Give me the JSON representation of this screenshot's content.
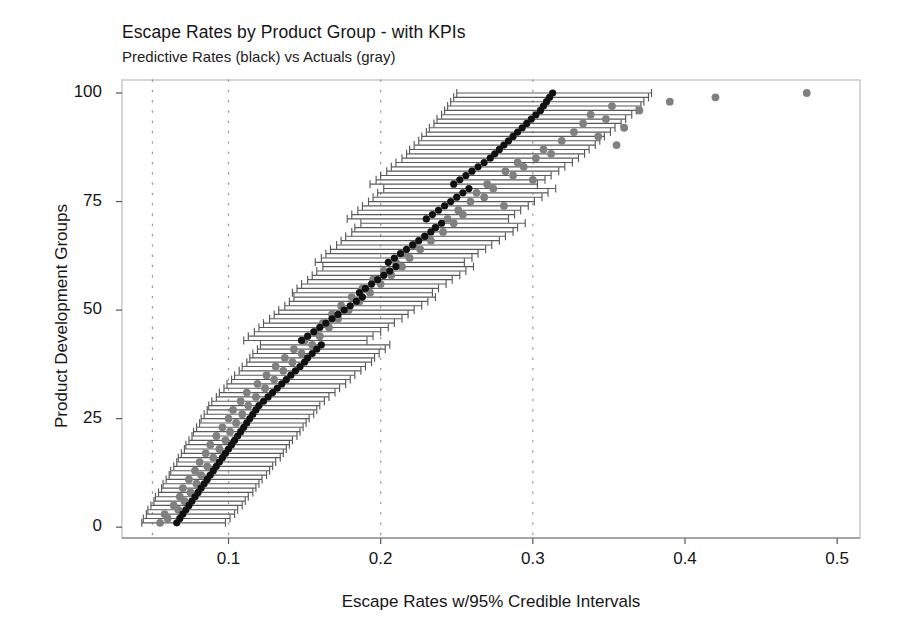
{
  "chart_data": {
    "type": "scatter",
    "title": "Escape Rates by Product Group - with KPIs",
    "subtitle": "Predictive Rates (black) vs Actuals (gray)",
    "xlabel": "Escape Rates w/95% Credible Intervals",
    "ylabel": "Product Development Groups",
    "xlim": [
      0.03,
      0.515
    ],
    "ylim": [
      -2.5,
      103
    ],
    "xticks": [
      0.1,
      0.2,
      0.3,
      0.4,
      0.5
    ],
    "xtick_labels": [
      "0.1",
      "0.2",
      "0.3",
      "0.4",
      "0.5"
    ],
    "yticks": [
      0,
      25,
      50,
      75,
      100
    ],
    "ytick_labels": [
      "0",
      "25",
      "50",
      "75",
      "100"
    ],
    "gridlines_x": [
      0.05,
      0.1,
      0.2,
      0.3
    ],
    "grid_style": "dotted-vertical",
    "grid_color": "#9a9a9a",
    "frame_color": "#bbbbbb",
    "colors": {
      "predictive": "#111111",
      "actual": "#808080",
      "errorbar": "#5a5a5a"
    },
    "legend": [
      {
        "name": "Predictive Rates",
        "color": "#111111",
        "marker": "filled-circle"
      },
      {
        "name": "Actuals",
        "color": "#808080",
        "marker": "filled-circle"
      }
    ],
    "series": [
      {
        "name": "Predictive Rates (black)",
        "marker": "filled-circle",
        "color": "#111111",
        "points": [
          {
            "group": 1,
            "predicted": 0.066,
            "lo": 0.043,
            "hi": 0.098,
            "actual": 0.055
          },
          {
            "group": 2,
            "predicted": 0.068,
            "lo": 0.044,
            "hi": 0.101,
            "actual": 0.06
          },
          {
            "group": 3,
            "predicted": 0.07,
            "lo": 0.046,
            "hi": 0.104,
            "actual": 0.058
          },
          {
            "group": 4,
            "predicted": 0.072,
            "lo": 0.047,
            "hi": 0.106,
            "actual": 0.067
          },
          {
            "group": 5,
            "predicted": 0.074,
            "lo": 0.049,
            "hi": 0.109,
            "actual": 0.064
          },
          {
            "group": 6,
            "predicted": 0.076,
            "lo": 0.051,
            "hi": 0.111,
            "actual": 0.071
          },
          {
            "group": 7,
            "predicted": 0.078,
            "lo": 0.052,
            "hi": 0.113,
            "actual": 0.068
          },
          {
            "group": 8,
            "predicted": 0.08,
            "lo": 0.054,
            "hi": 0.116,
            "actual": 0.075
          },
          {
            "group": 9,
            "predicted": 0.082,
            "lo": 0.056,
            "hi": 0.118,
            "actual": 0.07
          },
          {
            "group": 10,
            "predicted": 0.084,
            "lo": 0.057,
            "hi": 0.12,
            "actual": 0.079
          },
          {
            "group": 11,
            "predicted": 0.086,
            "lo": 0.059,
            "hi": 0.122,
            "actual": 0.074
          },
          {
            "group": 12,
            "predicted": 0.088,
            "lo": 0.061,
            "hi": 0.125,
            "actual": 0.082
          },
          {
            "group": 13,
            "predicted": 0.09,
            "lo": 0.062,
            "hi": 0.127,
            "actual": 0.078
          },
          {
            "group": 14,
            "predicted": 0.092,
            "lo": 0.064,
            "hi": 0.129,
            "actual": 0.086
          },
          {
            "group": 15,
            "predicted": 0.094,
            "lo": 0.066,
            "hi": 0.131,
            "actual": 0.081
          },
          {
            "group": 16,
            "predicted": 0.096,
            "lo": 0.067,
            "hi": 0.134,
            "actual": 0.09
          },
          {
            "group": 17,
            "predicted": 0.098,
            "lo": 0.069,
            "hi": 0.136,
            "actual": 0.085
          },
          {
            "group": 18,
            "predicted": 0.1,
            "lo": 0.071,
            "hi": 0.138,
            "actual": 0.094
          },
          {
            "group": 19,
            "predicted": 0.102,
            "lo": 0.072,
            "hi": 0.14,
            "actual": 0.088
          },
          {
            "group": 20,
            "predicted": 0.104,
            "lo": 0.074,
            "hi": 0.142,
            "actual": 0.098
          },
          {
            "group": 21,
            "predicted": 0.106,
            "lo": 0.076,
            "hi": 0.145,
            "actual": 0.092
          },
          {
            "group": 22,
            "predicted": 0.108,
            "lo": 0.077,
            "hi": 0.147,
            "actual": 0.101
          },
          {
            "group": 23,
            "predicted": 0.11,
            "lo": 0.079,
            "hi": 0.149,
            "actual": 0.096
          },
          {
            "group": 24,
            "predicted": 0.112,
            "lo": 0.081,
            "hi": 0.151,
            "actual": 0.105
          },
          {
            "group": 25,
            "predicted": 0.114,
            "lo": 0.082,
            "hi": 0.153,
            "actual": 0.1
          },
          {
            "group": 26,
            "predicted": 0.116,
            "lo": 0.084,
            "hi": 0.156,
            "actual": 0.109
          },
          {
            "group": 27,
            "predicted": 0.118,
            "lo": 0.086,
            "hi": 0.158,
            "actual": 0.103
          },
          {
            "group": 28,
            "predicted": 0.12,
            "lo": 0.087,
            "hi": 0.16,
            "actual": 0.113
          },
          {
            "group": 29,
            "predicted": 0.123,
            "lo": 0.089,
            "hi": 0.163,
            "actual": 0.108
          },
          {
            "group": 30,
            "predicted": 0.126,
            "lo": 0.092,
            "hi": 0.166,
            "actual": 0.118
          },
          {
            "group": 31,
            "predicted": 0.129,
            "lo": 0.094,
            "hi": 0.17,
            "actual": 0.112
          },
          {
            "group": 32,
            "predicted": 0.132,
            "lo": 0.097,
            "hi": 0.173,
            "actual": 0.124
          },
          {
            "group": 33,
            "predicted": 0.135,
            "lo": 0.099,
            "hi": 0.177,
            "actual": 0.119
          },
          {
            "group": 34,
            "predicted": 0.138,
            "lo": 0.102,
            "hi": 0.18,
            "actual": 0.13
          },
          {
            "group": 35,
            "predicted": 0.141,
            "lo": 0.104,
            "hi": 0.183,
            "actual": 0.125
          },
          {
            "group": 36,
            "predicted": 0.144,
            "lo": 0.107,
            "hi": 0.187,
            "actual": 0.136
          },
          {
            "group": 37,
            "predicted": 0.147,
            "lo": 0.109,
            "hi": 0.19,
            "actual": 0.131
          },
          {
            "group": 38,
            "predicted": 0.15,
            "lo": 0.112,
            "hi": 0.194,
            "actual": 0.142
          },
          {
            "group": 39,
            "predicted": 0.152,
            "lo": 0.114,
            "hi": 0.196,
            "actual": 0.137
          },
          {
            "group": 40,
            "predicted": 0.155,
            "lo": 0.116,
            "hi": 0.199,
            "actual": 0.148
          },
          {
            "group": 41,
            "predicted": 0.158,
            "lo": 0.119,
            "hi": 0.203,
            "actual": 0.143
          },
          {
            "group": 42,
            "predicted": 0.161,
            "lo": 0.121,
            "hi": 0.206,
            "actual": 0.155
          },
          {
            "group": 43,
            "predicted": 0.148,
            "lo": 0.11,
            "hi": 0.191,
            "actual": 0.15
          },
          {
            "group": 44,
            "predicted": 0.152,
            "lo": 0.113,
            "hi": 0.195,
            "actual": 0.16
          },
          {
            "group": 45,
            "predicted": 0.156,
            "lo": 0.117,
            "hi": 0.2,
            "actual": 0.157
          },
          {
            "group": 46,
            "predicted": 0.16,
            "lo": 0.12,
            "hi": 0.205,
            "actual": 0.166
          },
          {
            "group": 47,
            "predicted": 0.164,
            "lo": 0.123,
            "hi": 0.209,
            "actual": 0.162
          },
          {
            "group": 48,
            "predicted": 0.168,
            "lo": 0.127,
            "hi": 0.214,
            "actual": 0.172
          },
          {
            "group": 49,
            "predicted": 0.172,
            "lo": 0.13,
            "hi": 0.218,
            "actual": 0.168
          },
          {
            "group": 50,
            "predicted": 0.176,
            "lo": 0.133,
            "hi": 0.222,
            "actual": 0.179
          },
          {
            "group": 51,
            "predicted": 0.18,
            "lo": 0.137,
            "hi": 0.227,
            "actual": 0.174
          },
          {
            "group": 52,
            "predicted": 0.184,
            "lo": 0.14,
            "hi": 0.231,
            "actual": 0.186
          },
          {
            "group": 53,
            "predicted": 0.188,
            "lo": 0.143,
            "hi": 0.236,
            "actual": 0.181
          },
          {
            "group": 54,
            "predicted": 0.186,
            "lo": 0.142,
            "hi": 0.234,
            "actual": 0.193
          },
          {
            "group": 55,
            "predicted": 0.19,
            "lo": 0.145,
            "hi": 0.238,
            "actual": 0.188
          },
          {
            "group": 56,
            "predicted": 0.194,
            "lo": 0.148,
            "hi": 0.243,
            "actual": 0.2
          },
          {
            "group": 57,
            "predicted": 0.198,
            "lo": 0.152,
            "hi": 0.247,
            "actual": 0.195
          },
          {
            "group": 58,
            "predicted": 0.202,
            "lo": 0.155,
            "hi": 0.252,
            "actual": 0.207
          },
          {
            "group": 59,
            "predicted": 0.206,
            "lo": 0.158,
            "hi": 0.256,
            "actual": 0.202
          },
          {
            "group": 60,
            "predicted": 0.21,
            "lo": 0.162,
            "hi": 0.261,
            "actual": 0.214
          },
          {
            "group": 61,
            "predicted": 0.205,
            "lo": 0.157,
            "hi": 0.255,
            "actual": 0.21
          },
          {
            "group": 62,
            "predicted": 0.209,
            "lo": 0.161,
            "hi": 0.26,
            "actual": 0.219
          },
          {
            "group": 63,
            "predicted": 0.213,
            "lo": 0.164,
            "hi": 0.264,
            "actual": 0.216
          },
          {
            "group": 64,
            "predicted": 0.217,
            "lo": 0.167,
            "hi": 0.269,
            "actual": 0.226
          },
          {
            "group": 65,
            "predicted": 0.221,
            "lo": 0.171,
            "hi": 0.273,
            "actual": 0.222
          },
          {
            "group": 66,
            "predicted": 0.225,
            "lo": 0.174,
            "hi": 0.278,
            "actual": 0.233
          },
          {
            "group": 67,
            "predicted": 0.229,
            "lo": 0.177,
            "hi": 0.282,
            "actual": 0.229
          },
          {
            "group": 68,
            "predicted": 0.233,
            "lo": 0.181,
            "hi": 0.287,
            "actual": 0.241
          },
          {
            "group": 69,
            "predicted": 0.236,
            "lo": 0.183,
            "hi": 0.29,
            "actual": 0.236
          },
          {
            "group": 70,
            "predicted": 0.24,
            "lo": 0.187,
            "hi": 0.295,
            "actual": 0.248
          },
          {
            "group": 71,
            "predicted": 0.23,
            "lo": 0.178,
            "hi": 0.284,
            "actual": 0.244
          },
          {
            "group": 72,
            "predicted": 0.234,
            "lo": 0.181,
            "hi": 0.288,
            "actual": 0.254
          },
          {
            "group": 73,
            "predicted": 0.238,
            "lo": 0.185,
            "hi": 0.292,
            "actual": 0.251
          },
          {
            "group": 74,
            "predicted": 0.242,
            "lo": 0.188,
            "hi": 0.297,
            "actual": 0.281
          },
          {
            "group": 75,
            "predicted": 0.246,
            "lo": 0.192,
            "hi": 0.301,
            "actual": 0.259
          },
          {
            "group": 76,
            "predicted": 0.25,
            "lo": 0.195,
            "hi": 0.306,
            "actual": 0.268
          },
          {
            "group": 77,
            "predicted": 0.254,
            "lo": 0.198,
            "hi": 0.31,
            "actual": 0.263
          },
          {
            "group": 78,
            "predicted": 0.258,
            "lo": 0.202,
            "hi": 0.315,
            "actual": 0.274
          },
          {
            "group": 79,
            "predicted": 0.248,
            "lo": 0.193,
            "hi": 0.303,
            "actual": 0.27
          },
          {
            "group": 80,
            "predicted": 0.252,
            "lo": 0.197,
            "hi": 0.308,
            "actual": 0.3
          },
          {
            "group": 81,
            "predicted": 0.256,
            "lo": 0.2,
            "hi": 0.312,
            "actual": 0.287
          },
          {
            "group": 82,
            "predicted": 0.26,
            "lo": 0.204,
            "hi": 0.317,
            "actual": 0.282
          },
          {
            "group": 83,
            "predicted": 0.264,
            "lo": 0.207,
            "hi": 0.321,
            "actual": 0.294
          },
          {
            "group": 84,
            "predicted": 0.268,
            "lo": 0.21,
            "hi": 0.326,
            "actual": 0.29
          },
          {
            "group": 85,
            "predicted": 0.272,
            "lo": 0.214,
            "hi": 0.33,
            "actual": 0.302
          },
          {
            "group": 86,
            "predicted": 0.275,
            "lo": 0.217,
            "hi": 0.334,
            "actual": 0.312
          },
          {
            "group": 87,
            "predicted": 0.278,
            "lo": 0.219,
            "hi": 0.337,
            "actual": 0.307
          },
          {
            "group": 88,
            "predicted": 0.281,
            "lo": 0.222,
            "hi": 0.341,
            "actual": 0.355
          },
          {
            "group": 89,
            "predicted": 0.284,
            "lo": 0.225,
            "hi": 0.344,
            "actual": 0.319
          },
          {
            "group": 90,
            "predicted": 0.287,
            "lo": 0.227,
            "hi": 0.347,
            "actual": 0.343
          },
          {
            "group": 91,
            "predicted": 0.29,
            "lo": 0.23,
            "hi": 0.351,
            "actual": 0.327
          },
          {
            "group": 92,
            "predicted": 0.293,
            "lo": 0.232,
            "hi": 0.354,
            "actual": 0.36
          },
          {
            "group": 93,
            "predicted": 0.296,
            "lo": 0.235,
            "hi": 0.358,
            "actual": 0.333
          },
          {
            "group": 94,
            "predicted": 0.299,
            "lo": 0.237,
            "hi": 0.361,
            "actual": 0.348
          },
          {
            "group": 95,
            "predicted": 0.302,
            "lo": 0.24,
            "hi": 0.365,
            "actual": 0.338
          },
          {
            "group": 96,
            "predicted": 0.305,
            "lo": 0.242,
            "hi": 0.368,
            "actual": 0.37
          },
          {
            "group": 97,
            "predicted": 0.307,
            "lo": 0.244,
            "hi": 0.371,
            "actual": 0.352
          },
          {
            "group": 98,
            "predicted": 0.309,
            "lo": 0.246,
            "hi": 0.373,
            "actual": 0.39
          },
          {
            "group": 99,
            "predicted": 0.311,
            "lo": 0.248,
            "hi": 0.376,
            "actual": 0.42
          },
          {
            "group": 100,
            "predicted": 0.313,
            "lo": 0.25,
            "hi": 0.378,
            "actual": 0.48
          }
        ]
      }
    ]
  }
}
